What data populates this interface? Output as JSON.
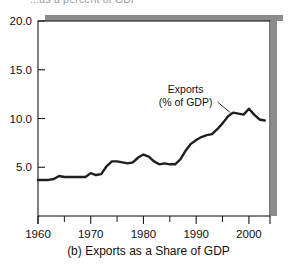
{
  "figure": {
    "clipped_header": "...as a percent of GDP",
    "caption": "(b) Exports as a Share of GDP",
    "frame_color": "#1a1a1a",
    "shadow_color": "#8c8c8c",
    "line_color": "#1f1f1f",
    "background": "#ffffff"
  },
  "annotation": {
    "line1": "Exports",
    "line2": "(% of GDP)"
  },
  "chart_data": {
    "type": "line",
    "title": "",
    "subtitle": "",
    "xlabel": "",
    "ylabel": "",
    "xlim": [
      1960,
      2004
    ],
    "ylim": [
      0,
      20
    ],
    "yticks": [
      5.0,
      10.0,
      15.0,
      20.0
    ],
    "ytick_labels": [
      "5.0",
      "10.0",
      "15.0",
      "20.0"
    ],
    "xticks": [
      1960,
      1970,
      1980,
      1990,
      2000
    ],
    "xtick_labels": [
      "1960",
      "1970",
      "1980",
      "1990",
      "2000"
    ],
    "xminor_ticks": [
      1965,
      1975,
      1985,
      1995
    ],
    "grid": false,
    "legend": "none",
    "annotations": [
      {
        "text": "Exports (% of GDP)",
        "x": 1988,
        "y": 12.6,
        "points_to_x": 1996.5,
        "points_to_y": 10.6
      }
    ],
    "series": [
      {
        "name": "Exports (% of GDP)",
        "x": [
          1960,
          1961,
          1962,
          1963,
          1964,
          1965,
          1966,
          1967,
          1968,
          1969,
          1970,
          1971,
          1972,
          1973,
          1974,
          1975,
          1976,
          1977,
          1978,
          1979,
          1980,
          1981,
          1982,
          1983,
          1984,
          1985,
          1986,
          1987,
          1988,
          1989,
          1990,
          1991,
          1992,
          1993,
          1994,
          1995,
          1996,
          1997,
          1998,
          1999,
          2000,
          2001,
          2002,
          2003
        ],
        "values": [
          3.7,
          3.7,
          3.7,
          3.8,
          4.1,
          4.0,
          4.0,
          4.0,
          4.0,
          4.0,
          4.4,
          4.2,
          4.3,
          5.1,
          5.6,
          5.6,
          5.5,
          5.4,
          5.5,
          6.0,
          6.3,
          6.1,
          5.6,
          5.3,
          5.4,
          5.3,
          5.3,
          5.8,
          6.7,
          7.4,
          7.8,
          8.1,
          8.3,
          8.4,
          8.9,
          9.5,
          10.2,
          10.6,
          10.5,
          10.4,
          11.0,
          10.4,
          9.9,
          9.8
        ]
      }
    ]
  }
}
